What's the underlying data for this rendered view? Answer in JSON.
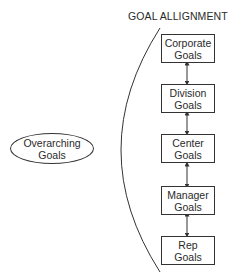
{
  "title": "GOAL ALLIGNMENT",
  "source": {
    "line1": "Overarching",
    "line2": "Goals"
  },
  "hierarchy": [
    {
      "line1": "Corporate",
      "line2": "Goals"
    },
    {
      "line1": "Division",
      "line2": "Goals"
    },
    {
      "line1": "Center",
      "line2": "Goals"
    },
    {
      "line1": "Manager",
      "line2": "Goals"
    },
    {
      "line1": "Rep",
      "line2": "Goals"
    }
  ],
  "connectors": "bidirectional-arrows"
}
